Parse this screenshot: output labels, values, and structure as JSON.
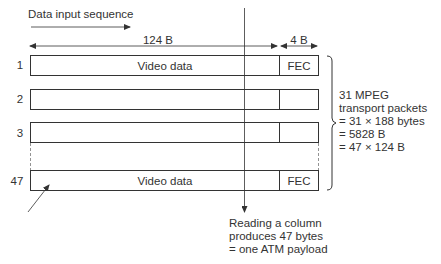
{
  "sequence_label": "Data input sequence",
  "dimensions": {
    "data_width": "124 B",
    "fec_width": "4 B"
  },
  "rows": [
    {
      "number": "1",
      "data_label": "Video data",
      "fec_label": "FEC"
    },
    {
      "number": "2",
      "data_label": "",
      "fec_label": ""
    },
    {
      "number": "3",
      "data_label": "",
      "fec_label": ""
    },
    {
      "number": "47",
      "data_label": "Video data",
      "fec_label": "FEC"
    }
  ],
  "brace_annotation": [
    "31 MPEG",
    "transport packets",
    "= 31 × 188 bytes",
    "= 5828 B",
    "= 47 × 124 B"
  ],
  "column_annotation": [
    "Reading a column",
    "produces 47 bytes",
    "= one ATM payload"
  ],
  "colors": {
    "line": "#333333",
    "background": "#ffffff"
  }
}
